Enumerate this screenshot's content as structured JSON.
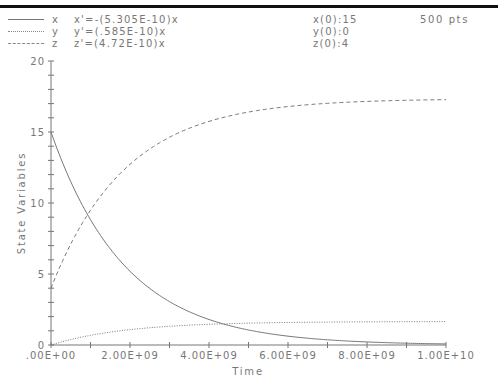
{
  "header": {
    "rule_color": "#111111"
  },
  "legend": {
    "items": [
      {
        "name": "x",
        "style": "solid",
        "equation": "x'=-(5.305E-10)x",
        "initial": "x(0):15"
      },
      {
        "name": "y",
        "style": "dotted",
        "equation": "y'=(.585E-10)x",
        "initial": "y(0):0"
      },
      {
        "name": "z",
        "style": "dashed",
        "equation": "z'=(4.72E-10)x",
        "initial": "z(0):4"
      }
    ],
    "points_label": "500 pts"
  },
  "chart_data": {
    "type": "line",
    "title": "",
    "xlabel": "Time",
    "ylabel": "State Variables",
    "xlim": [
      0,
      10000000000
    ],
    "ylim": [
      0,
      20
    ],
    "grid": false,
    "legend_position": "top-left",
    "x_tick_labels": [
      ".00E+00",
      "2.00E+09",
      "4.00E+09",
      "6.00E+09",
      "8.00E+09",
      "1.00E+10"
    ],
    "x_tick_values": [
      0,
      2000000000,
      4000000000,
      6000000000,
      8000000000,
      10000000000
    ],
    "x_minor_step": 1000000000,
    "y_tick_labels": [
      "0",
      "5",
      "10",
      "15",
      "20"
    ],
    "y_tick_values": [
      0,
      5,
      10,
      15,
      20
    ],
    "y_minor_step": 1,
    "n_points": 500,
    "model": {
      "k_x": 5.305e-10,
      "k_y": 5.85e-11,
      "k_z": 4.72e-10,
      "x0": 15,
      "y0": 0,
      "z0": 4
    },
    "x": [
      0,
      1000000000,
      2000000000,
      3000000000,
      4000000000,
      5000000000,
      6000000000,
      7000000000,
      8000000000,
      9000000000,
      10000000000
    ],
    "series": [
      {
        "name": "x",
        "style": "solid",
        "values": [
          15,
          8.82,
          5.19,
          3.05,
          1.8,
          1.06,
          0.62,
          0.37,
          0.22,
          0.13,
          0.07
        ]
      },
      {
        "name": "y",
        "style": "dotted",
        "values": [
          0,
          0.68,
          1.08,
          1.32,
          1.46,
          1.54,
          1.59,
          1.61,
          1.63,
          1.64,
          1.65
        ]
      },
      {
        "name": "z",
        "style": "dashed",
        "values": [
          4,
          9.5,
          12.73,
          14.63,
          15.75,
          16.41,
          16.79,
          17.02,
          17.15,
          17.23,
          17.28
        ]
      }
    ],
    "line_color": "#777777"
  }
}
